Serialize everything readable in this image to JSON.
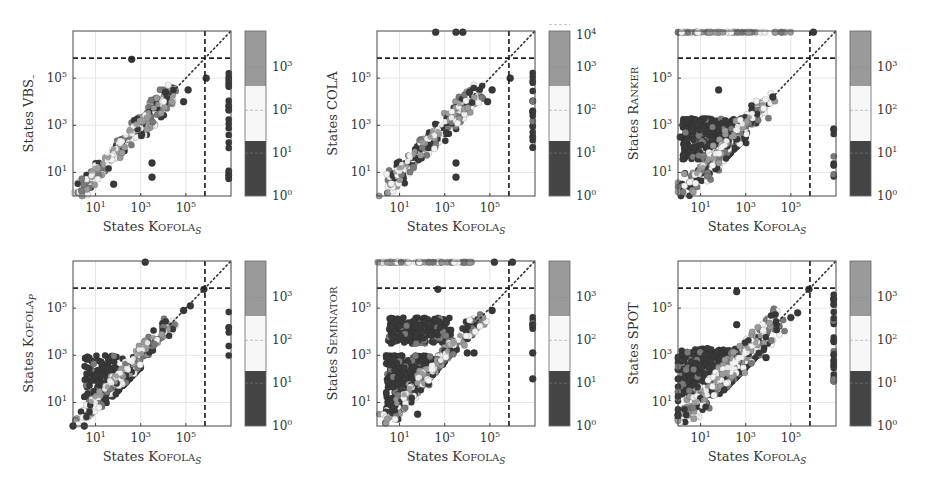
{
  "figure": {
    "colors": {
      "dark": "#383838",
      "mid": "#7a7a7a",
      "light": "#f2f2f2",
      "gray": "#9a9a9a",
      "frame": "#444444",
      "grid": "#e6e6e6"
    }
  },
  "chart_data": [
    {
      "type": "scatter",
      "title": "",
      "xlabel": "States Kofola_S",
      "ylabel": "States VBS_",
      "xscale": "log",
      "yscale": "log",
      "xticks": [
        "10^1",
        "10^3",
        "10^5"
      ],
      "yticks": [
        "10^1",
        "10^3",
        "10^5"
      ],
      "timeout_line": 700000,
      "colorbar": {
        "label_ticks": [
          "10^0",
          "10^1",
          "10^2",
          "10^3"
        ],
        "max": 10000
      },
      "description": "Points tightly along diagonal; outliers at timeout column (right edge)",
      "clusters": [
        {
          "x": [
            0.3,
            4.5
          ],
          "y": [
            0.2,
            4.5
          ],
          "spread": 0.35,
          "n": 220,
          "kind": "diag"
        },
        {
          "x": [
            6.9,
            6.9
          ],
          "y": [
            0.7,
            5.3
          ],
          "n": 26,
          "kind": "col"
        }
      ],
      "points": [
        [
          2.6,
          5.8
        ],
        [
          3.5,
          1.4
        ],
        [
          3.5,
          0.8
        ],
        [
          1.8,
          0.5
        ],
        [
          5.1,
          4.5
        ],
        [
          4.9,
          4.0
        ],
        [
          5.9,
          5.0
        ],
        [
          4.1,
          4.4
        ]
      ]
    },
    {
      "type": "scatter",
      "xlabel": "States Kofola_S",
      "ylabel": "States COLA",
      "xscale": "log",
      "yscale": "log",
      "xticks": [
        "10^1",
        "10^3",
        "10^5"
      ],
      "yticks": [
        "10^1",
        "10^3",
        "10^5"
      ],
      "timeout_line": 700000,
      "colorbar": {
        "label_ticks": [
          "10^0",
          "10^1",
          "10^2",
          "10^3",
          "10^4"
        ],
        "max": 10000
      },
      "clusters": [
        {
          "x": [
            0.3,
            4.5
          ],
          "y": [
            0.2,
            4.5
          ],
          "spread": 0.35,
          "n": 220,
          "kind": "diag"
        },
        {
          "x": [
            6.9,
            6.9
          ],
          "y": [
            2.0,
            5.3
          ],
          "n": 22,
          "kind": "col"
        }
      ],
      "points": [
        [
          2.6,
          6.95
        ],
        [
          3.5,
          6.95
        ],
        [
          3.8,
          6.95
        ],
        [
          3.5,
          1.4
        ],
        [
          3.5,
          0.8
        ],
        [
          5.1,
          4.5
        ],
        [
          4.9,
          4.0
        ],
        [
          5.9,
          5.0
        ],
        [
          4.1,
          4.4
        ]
      ]
    },
    {
      "type": "scatter",
      "xlabel": "States Kofola_S",
      "ylabel": "States Ranker",
      "xscale": "log",
      "yscale": "log",
      "xticks": [
        "10^1",
        "10^3",
        "10^5"
      ],
      "yticks": [
        "10^1",
        "10^3",
        "10^5"
      ],
      "timeout_line": 700000,
      "colorbar": {
        "label_ticks": [
          "10^0",
          "10^1",
          "10^2",
          "10^3"
        ],
        "max": 10000
      },
      "clusters": [
        {
          "x": [
            0.2,
            3.0
          ],
          "y": [
            1.5,
            3.3
          ],
          "spread": 0.6,
          "n": 350,
          "kind": "block"
        },
        {
          "x": [
            0.2,
            4.0
          ],
          "y": [
            0.2,
            4.0
          ],
          "spread": 0.4,
          "n": 200,
          "kind": "diag"
        },
        {
          "x": [
            0.0,
            5.0
          ],
          "y": [
            6.95,
            6.95
          ],
          "n": 60,
          "kind": "row"
        },
        {
          "x": [
            6.9,
            6.9
          ],
          "y": [
            0.8,
            3.3
          ],
          "n": 10,
          "kind": "col"
        }
      ],
      "points": [
        [
          1.8,
          4.5
        ],
        [
          4.2,
          4.2
        ],
        [
          6.0,
          6.95
        ],
        [
          0.1,
          2.5
        ]
      ]
    },
    {
      "type": "scatter",
      "xlabel": "States Kofola_S",
      "ylabel": "States Kofola_P",
      "xscale": "log",
      "yscale": "log",
      "xticks": [
        "10^1",
        "10^3",
        "10^5"
      ],
      "yticks": [
        "10^1",
        "10^3",
        "10^5"
      ],
      "timeout_line": 700000,
      "colorbar": {
        "label_ticks": [
          "10^0",
          "10^1",
          "10^2",
          "10^3"
        ],
        "max": 10000
      },
      "clusters": [
        {
          "x": [
            0.5,
            3.0
          ],
          "y": [
            1.2,
            3.0
          ],
          "spread": 0.5,
          "n": 200,
          "kind": "block"
        },
        {
          "x": [
            0.3,
            4.5
          ],
          "y": [
            0.2,
            4.5
          ],
          "spread": 0.3,
          "n": 200,
          "kind": "diag"
        },
        {
          "x": [
            6.9,
            6.9
          ],
          "y": [
            2.6,
            5.0
          ],
          "n": 6,
          "kind": "col"
        }
      ],
      "points": [
        [
          3.2,
          6.95
        ],
        [
          5.8,
          5.8
        ],
        [
          5.2,
          5.1
        ],
        [
          4.9,
          4.9
        ],
        [
          0.0,
          0.0
        ],
        [
          0.5,
          0.0
        ]
      ]
    },
    {
      "type": "scatter",
      "xlabel": "States Kofola_S",
      "ylabel": "States Seminator",
      "xscale": "log",
      "yscale": "log",
      "xticks": [
        "10^1",
        "10^3",
        "10^5"
      ],
      "yticks": [
        "10^1",
        "10^3",
        "10^5"
      ],
      "timeout_line": 700000,
      "colorbar": {
        "label_ticks": [
          "10^0",
          "10^1",
          "10^2",
          "10^3"
        ],
        "max": 10000
      },
      "clusters": [
        {
          "x": [
            0.4,
            3.0
          ],
          "y": [
            0.6,
            3.0
          ],
          "spread": 0.0,
          "n": 500,
          "kind": "block"
        },
        {
          "x": [
            0.5,
            3.3
          ],
          "y": [
            3.5,
            4.6
          ],
          "spread": 0.0,
          "n": 260,
          "kind": "block"
        },
        {
          "x": [
            0.3,
            4.6
          ],
          "y": [
            0.2,
            4.6
          ],
          "spread": 0.3,
          "n": 200,
          "kind": "diag"
        },
        {
          "x": [
            0.0,
            4.2
          ],
          "y": [
            6.95,
            6.95
          ],
          "n": 60,
          "kind": "row"
        },
        {
          "x": [
            6.9,
            6.9
          ],
          "y": [
            4.0,
            4.7
          ],
          "n": 8,
          "kind": "col"
        }
      ],
      "points": [
        [
          2.7,
          5.8
        ],
        [
          5.1,
          4.9
        ],
        [
          4.0,
          3.1
        ],
        [
          4.3,
          3.1
        ],
        [
          6.9,
          2.0
        ],
        [
          6.9,
          3.1
        ],
        [
          1.8,
          0.5
        ],
        [
          5.2,
          6.95
        ],
        [
          6.0,
          6.95
        ]
      ]
    },
    {
      "type": "scatter",
      "xlabel": "States Kofola_S",
      "ylabel": "States Spot",
      "xscale": "log",
      "yscale": "log",
      "xticks": [
        "10^1",
        "10^3",
        "10^5"
      ],
      "yticks": [
        "10^1",
        "10^3",
        "10^5"
      ],
      "timeout_line": 700000,
      "colorbar": {
        "label_ticks": [
          "10^0",
          "10^1",
          "10^2",
          "10^3"
        ],
        "max": 10000
      },
      "clusters": [
        {
          "x": [
            0.1,
            3.5
          ],
          "y": [
            1.3,
            3.3
          ],
          "spread": 0.5,
          "n": 420,
          "kind": "block"
        },
        {
          "x": [
            0.1,
            4.6
          ],
          "y": [
            0.2,
            4.6
          ],
          "spread": 0.4,
          "n": 260,
          "kind": "diag"
        },
        {
          "x": [
            0.0,
            0.0
          ],
          "y": [
            0.3,
            3.0
          ],
          "n": 20,
          "kind": "col"
        },
        {
          "x": [
            6.9,
            6.9
          ],
          "y": [
            1.8,
            5.6
          ],
          "n": 30,
          "kind": "col"
        }
      ],
      "points": [
        [
          2.6,
          5.7
        ],
        [
          2.6,
          4.3
        ],
        [
          5.0,
          4.6
        ],
        [
          5.3,
          4.8
        ],
        [
          5.8,
          5.8
        ],
        [
          3.9,
          2.9
        ]
      ]
    }
  ],
  "panels": [
    {
      "ylabel": "States VBS_",
      "xlabel_main": "States K",
      "xlabel_sc": "OFOLA",
      "xlabel_sub": "S"
    },
    {
      "ylabel": "States COLA",
      "xlabel_main": "States K",
      "xlabel_sc": "OFOLA",
      "xlabel_sub": "S"
    },
    {
      "ylabel": "States RANKER",
      "xlabel_main": "States K",
      "xlabel_sc": "OFOLA",
      "xlabel_sub": "S"
    },
    {
      "ylabel": "States KOFOLA_P",
      "xlabel_main": "States K",
      "xlabel_sc": "OFOLA",
      "xlabel_sub": "S"
    },
    {
      "ylabel": "States SEMINATOR",
      "xlabel_main": "States K",
      "xlabel_sc": "OFOLA",
      "xlabel_sub": "S"
    },
    {
      "ylabel": "States SPOT",
      "xlabel_main": "States K",
      "xlabel_sc": "OFOLA",
      "xlabel_sub": "S"
    }
  ]
}
